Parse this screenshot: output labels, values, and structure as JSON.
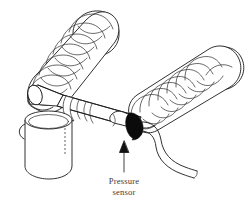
{
  "figure": {
    "type": "technical-line-drawing",
    "background_color": "#ffffff",
    "line_color": "#1b1b1b",
    "accent_color": "#0b0b0b",
    "text_color": "#3b3b3b",
    "annotations": {
      "pressure_sensor": {
        "line1": "Pressure",
        "line2": "sensor",
        "callout": "arrow-up"
      }
    },
    "parts": [
      {
        "name": "corrugated-tube-left",
        "label": ""
      },
      {
        "name": "corrugated-tube-right",
        "label": ""
      },
      {
        "name": "y-piece-body",
        "label": ""
      },
      {
        "name": "patient-connector-cylinder",
        "label": ""
      },
      {
        "name": "sensor-port-stub",
        "label": ""
      },
      {
        "name": "pressure-sensor-ring",
        "label": ""
      },
      {
        "name": "sensor-cable",
        "label": ""
      }
    ]
  }
}
